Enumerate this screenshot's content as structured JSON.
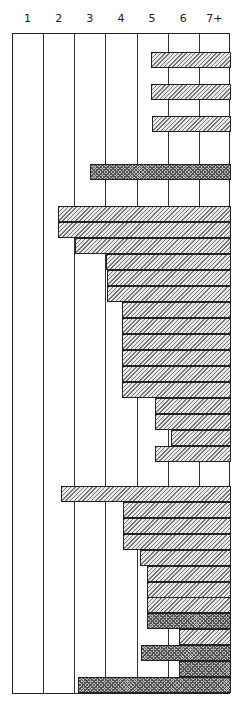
{
  "chart_data": {
    "type": "bar",
    "orientation": "horizontal",
    "title": "",
    "xlabel": "",
    "ylabel": "",
    "columns": [
      "1",
      "2",
      "3",
      "4",
      "5",
      "6",
      "7+"
    ],
    "xlim": [
      0,
      7
    ],
    "grid": true,
    "legend": [],
    "patterns": {
      "hatch": "diagonal-hatched",
      "dense": "cross-hatched (dark)"
    },
    "bars": [
      {
        "row": 1,
        "start": 4.5,
        "end": 7,
        "pattern": "hatch"
      },
      {
        "row": 3,
        "start": 4.5,
        "end": 7,
        "pattern": "hatch"
      },
      {
        "row": 5,
        "start": 4.5,
        "end": 7,
        "pattern": "hatch"
      },
      {
        "row": 8,
        "start": 2.5,
        "end": 7,
        "pattern": "dense"
      },
      {
        "row": 10.5,
        "start": 1.5,
        "end": 7,
        "pattern": "hatch"
      },
      {
        "row": 11.5,
        "start": 1.5,
        "end": 7,
        "pattern": "hatch"
      },
      {
        "row": 12.5,
        "start": 2.0,
        "end": 7,
        "pattern": "hatch"
      },
      {
        "row": 13.5,
        "start": 3.0,
        "end": 7,
        "pattern": "hatch"
      },
      {
        "row": 14.5,
        "start": 3.0,
        "end": 7,
        "pattern": "hatch"
      },
      {
        "row": 15.5,
        "start": 3.0,
        "end": 7,
        "pattern": "hatch"
      },
      {
        "row": 16.5,
        "start": 3.5,
        "end": 7,
        "pattern": "hatch"
      },
      {
        "row": 17.5,
        "start": 3.5,
        "end": 7,
        "pattern": "hatch"
      },
      {
        "row": 18.5,
        "start": 3.5,
        "end": 7,
        "pattern": "hatch"
      },
      {
        "row": 19.5,
        "start": 3.5,
        "end": 7,
        "pattern": "hatch"
      },
      {
        "row": 20.5,
        "start": 3.5,
        "end": 7,
        "pattern": "hatch"
      },
      {
        "row": 21.5,
        "start": 3.5,
        "end": 7,
        "pattern": "hatch"
      },
      {
        "row": 22.5,
        "start": 4.6,
        "end": 7,
        "pattern": "hatch"
      },
      {
        "row": 23.5,
        "start": 4.6,
        "end": 7,
        "pattern": "hatch"
      },
      {
        "row": 24.5,
        "start": 5.1,
        "end": 7,
        "pattern": "hatch"
      },
      {
        "row": 25.5,
        "start": 4.6,
        "end": 7,
        "pattern": "hatch"
      },
      {
        "row": 28,
        "start": 1.6,
        "end": 7,
        "pattern": "hatch"
      },
      {
        "row": 29,
        "start": 3.6,
        "end": 7,
        "pattern": "hatch"
      },
      {
        "row": 30,
        "start": 3.6,
        "end": 7,
        "pattern": "hatch"
      },
      {
        "row": 31,
        "start": 3.6,
        "end": 7,
        "pattern": "hatch"
      },
      {
        "row": 32,
        "start": 4.1,
        "end": 7,
        "pattern": "hatch"
      },
      {
        "row": 33,
        "start": 4.3,
        "end": 7,
        "pattern": "hatch"
      },
      {
        "row": 34,
        "start": 4.3,
        "end": 7,
        "pattern": "hatch"
      },
      {
        "row": 35,
        "start": 4.3,
        "end": 7,
        "pattern": "hatch"
      },
      {
        "row": 36,
        "start": 4.3,
        "end": 7,
        "pattern": "dense"
      },
      {
        "row": 37,
        "start": 5.4,
        "end": 7,
        "pattern": "hatch"
      },
      {
        "row": 38,
        "start": 4.2,
        "end": 7,
        "pattern": "dense"
      },
      {
        "row": 39,
        "start": 5.4,
        "end": 7,
        "pattern": "dense"
      },
      {
        "row": 40,
        "start": 2.1,
        "end": 7,
        "pattern": "dense"
      }
    ]
  },
  "layout": {
    "bar_px": [
      {
        "top": 52,
        "left": 151,
        "pattern": "hatch"
      },
      {
        "top": 84,
        "left": 151,
        "pattern": "hatch"
      },
      {
        "top": 116,
        "left": 152,
        "pattern": "hatch"
      },
      {
        "top": 164,
        "left": 90,
        "pattern": "dense"
      },
      {
        "top": 206,
        "left": 58,
        "pattern": "hatch"
      },
      {
        "top": 222,
        "left": 58,
        "pattern": "hatch"
      },
      {
        "top": 238,
        "left": 75,
        "pattern": "hatch"
      },
      {
        "top": 254,
        "left": 106,
        "pattern": "hatch"
      },
      {
        "top": 270,
        "left": 107,
        "pattern": "hatch"
      },
      {
        "top": 286,
        "left": 107,
        "pattern": "hatch"
      },
      {
        "top": 302,
        "left": 122,
        "pattern": "hatch"
      },
      {
        "top": 318,
        "left": 122,
        "pattern": "hatch"
      },
      {
        "top": 334,
        "left": 122,
        "pattern": "hatch"
      },
      {
        "top": 350,
        "left": 122,
        "pattern": "hatch"
      },
      {
        "top": 366,
        "left": 122,
        "pattern": "hatch"
      },
      {
        "top": 382,
        "left": 122,
        "pattern": "hatch"
      },
      {
        "top": 398,
        "left": 155,
        "pattern": "hatch"
      },
      {
        "top": 414,
        "left": 155,
        "pattern": "hatch"
      },
      {
        "top": 430,
        "left": 171,
        "pattern": "hatch"
      },
      {
        "top": 446,
        "left": 155,
        "pattern": "hatch"
      },
      {
        "top": 486,
        "left": 61,
        "pattern": "hatch"
      },
      {
        "top": 502,
        "left": 123,
        "pattern": "hatch"
      },
      {
        "top": 518,
        "left": 123,
        "pattern": "hatch"
      },
      {
        "top": 534,
        "left": 123,
        "pattern": "hatch"
      },
      {
        "top": 550,
        "left": 140,
        "pattern": "hatch"
      },
      {
        "top": 566,
        "left": 147,
        "pattern": "hatch"
      },
      {
        "top": 582,
        "left": 147,
        "pattern": "hatch"
      },
      {
        "top": 597,
        "left": 147,
        "pattern": "hatch"
      },
      {
        "top": 613,
        "left": 147,
        "pattern": "dense"
      },
      {
        "top": 629,
        "left": 179,
        "pattern": "hatch"
      },
      {
        "top": 645,
        "left": 141,
        "pattern": "dense"
      },
      {
        "top": 661,
        "left": 179,
        "pattern": "dense"
      },
      {
        "top": 677,
        "left": 78,
        "pattern": "dense"
      }
    ]
  }
}
